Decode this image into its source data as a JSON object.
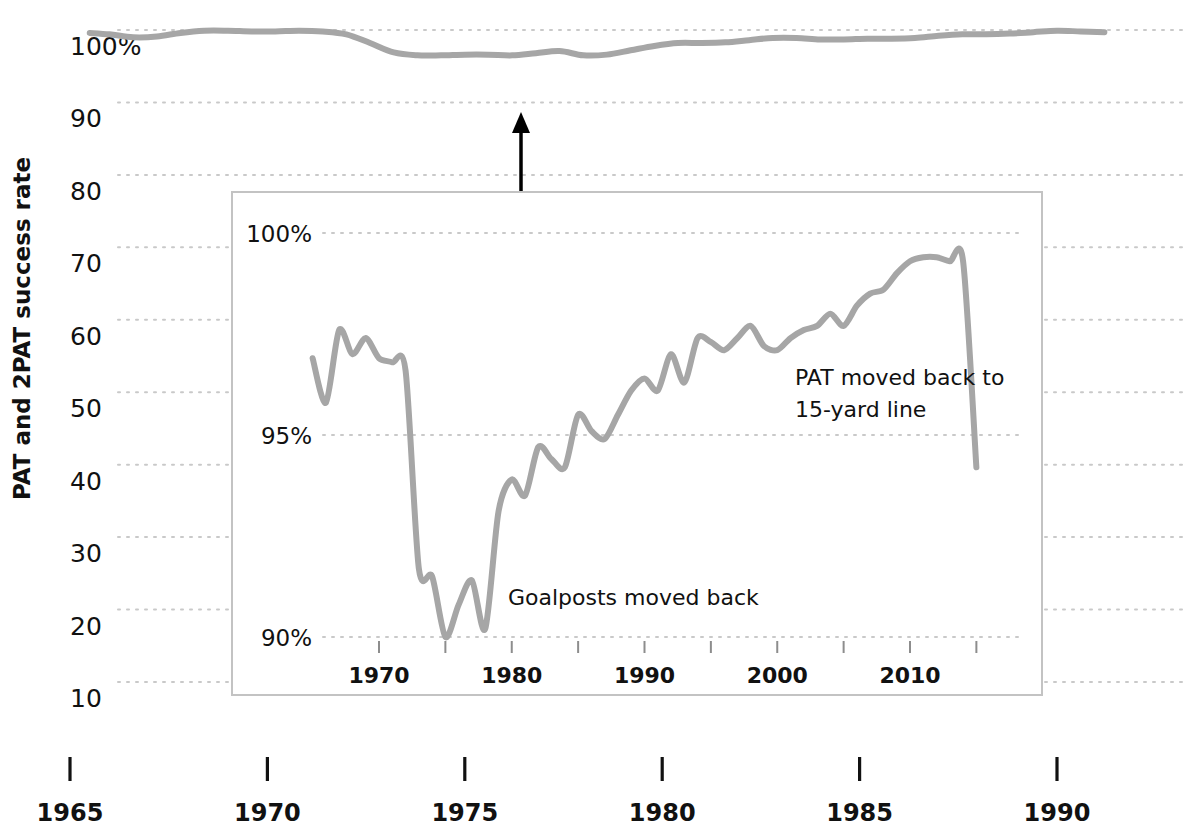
{
  "chart_data": {
    "type": "line",
    "title": "",
    "xlabel": "",
    "ylabel": "PAT and 2PAT success rate",
    "xlim": [
      1964.0,
      1991.6
    ],
    "ylim": [
      5,
      103
    ],
    "grid": true,
    "legend_position": "none",
    "line_color": "#a6a6a6",
    "gridline_color": "#c9c9c9",
    "background_color": "#ffffff",
    "yticks": [
      "100%",
      "90",
      "80",
      "70",
      "60",
      "50",
      "40",
      "30",
      "20",
      "10"
    ],
    "ytick_values": [
      100,
      90,
      80,
      70,
      60,
      50,
      40,
      30,
      20,
      10
    ],
    "xticks": [
      "1965",
      "1970",
      "1975",
      "1980",
      "1985",
      "1990"
    ],
    "xtick_values": [
      1965,
      1970,
      1975,
      1980,
      1985,
      1990
    ],
    "x": [
      1965.5,
      1966.0,
      1966.6,
      1967.2,
      1967.8,
      1968.4,
      1969.0,
      1969.6,
      1970.2,
      1970.8,
      1971.4,
      1972.0,
      1972.6,
      1973.2,
      1973.8,
      1974.4,
      1975.0,
      1975.6,
      1976.2,
      1976.8,
      1977.4,
      1978.0,
      1978.6,
      1979.2,
      1979.8,
      1980.4,
      1981.0,
      1981.6,
      1982.2,
      1982.8,
      1983.4,
      1984.0,
      1984.6,
      1985.2,
      1985.8,
      1986.4,
      1987.0,
      1987.6,
      1988.2,
      1988.8,
      1989.4,
      1990.0,
      1990.6,
      1991.2
    ],
    "values": [
      99.6,
      99.4,
      99.0,
      99.1,
      99.6,
      99.9,
      99.9,
      99.8,
      99.8,
      99.9,
      99.8,
      99.4,
      98.2,
      96.9,
      96.5,
      96.5,
      96.6,
      96.6,
      96.5,
      96.8,
      97.1,
      96.5,
      96.6,
      97.2,
      97.8,
      98.2,
      98.2,
      98.3,
      98.6,
      98.9,
      98.9,
      98.7,
      98.7,
      98.8,
      98.8,
      98.9,
      99.2,
      99.4,
      99.4,
      99.5,
      99.7,
      99.9,
      99.8,
      99.7
    ],
    "series_name": "PAT and 2PAT success rate",
    "annotations": [
      {
        "name": "inset-pointer-arrow",
        "type": "arrow",
        "x": 1975.3,
        "y_from": 88.0,
        "y_to": 95.8
      }
    ]
  },
  "inset_chart_data": {
    "type": "line",
    "title": "",
    "xlabel": "",
    "ylabel": "",
    "xlim": [
      1964.0,
      2016.5
    ],
    "ylim": [
      89.3,
      100.9
    ],
    "grid": true,
    "legend_position": "none",
    "line_color": "#a6a6a6",
    "gridline_color": "#c9c9c9",
    "border_color": "#c0c0c0",
    "yticks": [
      "100%",
      "95%",
      "90%"
    ],
    "ytick_values": [
      100,
      95,
      90
    ],
    "xticks": [
      "1970",
      "1980",
      "1990",
      "2000",
      "2010"
    ],
    "xtick_values": [
      1970,
      1980,
      1990,
      2000,
      2010
    ],
    "xtick_minor_values": [
      1970,
      1975,
      1980,
      1985,
      1990,
      1995,
      2000,
      2005,
      2010,
      2015
    ],
    "x": [
      1965.0,
      1966.0,
      1967.0,
      1968.0,
      1969.0,
      1970.0,
      1971.0,
      1972.0,
      1973.0,
      1974.0,
      1975.0,
      1976.0,
      1977.0,
      1978.0,
      1979.0,
      1980.0,
      1981.0,
      1982.0,
      1983.0,
      1984.0,
      1985.0,
      1986.0,
      1987.0,
      1988.0,
      1989.0,
      1990.0,
      1991.0,
      1992.0,
      1993.0,
      1994.0,
      1995.0,
      1996.0,
      1997.0,
      1998.0,
      1999.0,
      2000.0,
      2001.0,
      2002.0,
      2003.0,
      2004.0,
      2005.0,
      2006.0,
      2007.0,
      2008.0,
      2009.0,
      2010.0,
      2011.0,
      2012.0,
      2013.0,
      2014.0,
      2015.0
    ],
    "values": [
      96.9,
      95.8,
      97.6,
      97.0,
      97.4,
      96.9,
      96.8,
      96.6,
      91.7,
      91.5,
      90.0,
      90.8,
      91.4,
      90.2,
      93.1,
      93.9,
      93.5,
      94.7,
      94.4,
      94.2,
      95.5,
      95.1,
      94.9,
      95.5,
      96.1,
      96.4,
      96.1,
      97.0,
      96.3,
      97.4,
      97.3,
      97.1,
      97.4,
      97.7,
      97.2,
      97.1,
      97.4,
      97.6,
      97.7,
      98.0,
      97.7,
      98.2,
      98.5,
      98.6,
      99.0,
      99.3,
      99.4,
      99.4,
      99.3,
      99.3,
      94.2
    ],
    "series_name": "PAT and 2PAT success rate",
    "annotations": [
      {
        "name": "goalposts-annotation",
        "text": "Goalposts moved back",
        "x": 1977.0,
        "y": 91.4
      },
      {
        "name": "pat-moved-annotation-line1",
        "text": "PAT moved back to",
        "x": 1996.5,
        "y": 96.4
      },
      {
        "name": "pat-moved-annotation-line2",
        "text": "15-yard line",
        "x": 1996.5,
        "y": 95.7
      }
    ]
  },
  "axis": {
    "y_title": "PAT and 2PAT success rate"
  },
  "annotations": {
    "goalposts": "Goalposts moved back",
    "pat_line1": "PAT moved back to",
    "pat_line2": "15-yard line"
  },
  "colors": {
    "line": "#a6a6a6",
    "grid": "#c9c9c9",
    "inset_border": "#c0c0c0",
    "text": "#111111",
    "arrow": "#000000",
    "background": "#ffffff"
  }
}
